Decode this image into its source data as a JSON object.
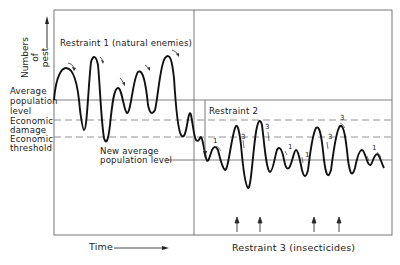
{
  "diagram": {
    "y_axis_label": "Numbers of pest",
    "x_axis_label": "Time",
    "levels": [
      {
        "name": "average_population_level",
        "label": "Average population level",
        "style": "solid"
      },
      {
        "name": "economic_damage",
        "label": "Economic damage",
        "style": "dashed"
      },
      {
        "name": "economic_threshold",
        "label": "Economic threshold",
        "style": "dashed"
      },
      {
        "name": "new_average_population_level",
        "label": "New average population level",
        "style": "solid"
      }
    ],
    "restraint_1": "Restraint 1 (natural enemies)",
    "restraint_2": "Restraint 2",
    "restraint_3": "Restraint 3 (insecticides)",
    "restraint_markers": {
      "one": "1",
      "three": "3"
    },
    "insecticide_arrow_count": 4
  },
  "labels": {
    "average": "Average",
    "population": "population",
    "level": "level",
    "economic": "Economic",
    "damage": "damage",
    "threshold": "threshold",
    "new_average": "New average",
    "population_level": "population level",
    "numbers_of": "Numbers of",
    "pest": "pest"
  }
}
